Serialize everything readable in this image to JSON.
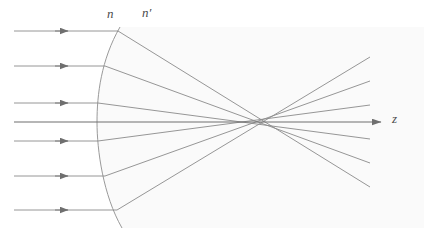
{
  "figure": {
    "background_color": "#ffffff",
    "width": 424,
    "height": 240
  },
  "labels": {
    "index_object_space": "n",
    "index_image_space": "n′",
    "optical_axis": "z"
  },
  "style": {
    "ray_color": "#8a8a8a",
    "axis_color": "#6f6f6f",
    "surface_color": "#9a9a9a",
    "medium_fill": "#fafafa",
    "label_color": "#4a4a4a",
    "ray_width": 0.9,
    "axis_width": 1.1,
    "surface_width": 1.0
  },
  "chart_data": {
    "type": "diagram",
    "xlabel": "z",
    "ylabel": "",
    "xlim": [
      0,
      424
    ],
    "ylim": [
      240,
      0
    ],
    "grid": false,
    "legend": false,
    "annotations": [
      {
        "text": "n",
        "x": 112,
        "y": 14,
        "role": "refractive-index-left-medium"
      },
      {
        "text": "n′",
        "x": 149,
        "y": 13,
        "role": "refractive-index-right-medium"
      },
      {
        "text": "z",
        "x": 397,
        "y": 119,
        "role": "optical-axis-label"
      }
    ],
    "optical_axis": {
      "x_start": 14,
      "x_end": 382,
      "y": 122,
      "arrow_at_end": true
    },
    "surface": {
      "kind": "spherical-refracting-surface",
      "vertex": [
        97,
        122
      ],
      "top_end": [
        120,
        27
      ],
      "bottom_end": [
        122,
        228
      ],
      "curvature": "convex-toward-incoming-rays"
    },
    "focus_region": {
      "paraxial_focus": [
        296,
        122
      ],
      "marginal_crossing": [
        274,
        122
      ]
    },
    "rays": [
      {
        "id": 1,
        "height": 31,
        "incident_x_start": 14,
        "hit": [
          118,
          31
        ],
        "cross_axis_at": 278,
        "end": [
          370,
          187
        ]
      },
      {
        "id": 2,
        "height": 66,
        "incident_x_start": 14,
        "hit": [
          105,
          66
        ],
        "cross_axis_at": 285,
        "end": [
          370,
          163
        ]
      },
      {
        "id": 3,
        "height": 103,
        "incident_x_start": 14,
        "hit": [
          98,
          103
        ],
        "cross_axis_at": 293,
        "end": [
          370,
          139
        ]
      },
      {
        "id": 4,
        "height": 122,
        "incident_x_start": 14,
        "hit": [
          97,
          122
        ],
        "cross_axis_at": 296,
        "end": [
          382,
          122
        ],
        "is_axis": true
      },
      {
        "id": 5,
        "height": 141,
        "incident_x_start": 14,
        "hit": [
          98,
          141
        ],
        "cross_axis_at": 293,
        "end": [
          370,
          105
        ]
      },
      {
        "id": 6,
        "height": 176,
        "incident_x_start": 14,
        "hit": [
          105,
          176
        ],
        "cross_axis_at": 285,
        "end": [
          370,
          81
        ]
      },
      {
        "id": 7,
        "height": 210,
        "incident_x_start": 14,
        "hit": [
          117,
          210
        ],
        "cross_axis_at": 278,
        "end": [
          370,
          57
        ]
      }
    ],
    "arrowheads_on_incident_rays": [
      {
        "ray": 1,
        "x": 67,
        "y": 31
      },
      {
        "ray": 2,
        "x": 67,
        "y": 66
      },
      {
        "ray": 3,
        "x": 67,
        "y": 103
      },
      {
        "ray": 5,
        "x": 67,
        "y": 141
      },
      {
        "ray": 6,
        "x": 67,
        "y": 176
      },
      {
        "ray": 7,
        "x": 67,
        "y": 210
      }
    ]
  }
}
